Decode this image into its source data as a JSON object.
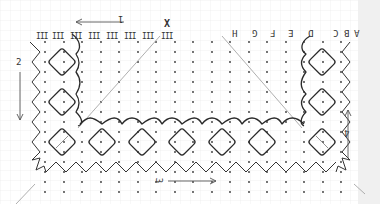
{
  "diagram": {
    "type": "bobbin-lace-pricking",
    "background": "graph-paper",
    "colors": {
      "grid": "#e6e6e6",
      "ink": "#2a2a2a",
      "dot": "#333333",
      "guide": "#9a9a9a",
      "margin": "#f0f0f0"
    },
    "column_letters": [
      "A",
      "B",
      "C",
      "D",
      "E",
      "F",
      "G",
      "H"
    ],
    "roman_numerals": [
      "III",
      "III",
      "III",
      "III",
      "III",
      "III",
      "III",
      "III"
    ],
    "start_mark": "X",
    "direction_labels": {
      "top": "1",
      "left": "2",
      "bottom": "3",
      "right": "4"
    },
    "diamonds": {
      "left_column": 3,
      "bottom_row": 5,
      "right_column": 3
    }
  }
}
